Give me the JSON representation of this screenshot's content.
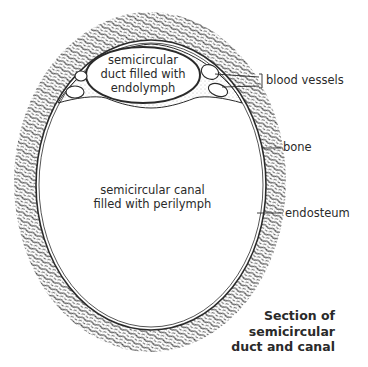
{
  "diagram": {
    "title": "Section of semicircular duct and canal",
    "caption_lines": [
      "Section of",
      "semicircular",
      "duct and canal"
    ],
    "regions": {
      "duct": {
        "lines": [
          "semicircular",
          "duct filled with",
          "endolymph"
        ]
      },
      "canal": {
        "lines": [
          "semicircular canal",
          "filled with perilymph"
        ]
      }
    },
    "labels": {
      "blood_vessels": "blood vessels",
      "bone": "bone",
      "endosteum": "endosteum"
    },
    "colors": {
      "ink": "#2a2a2a",
      "background": "#ffffff",
      "stipple": "#3a3a3a"
    }
  }
}
